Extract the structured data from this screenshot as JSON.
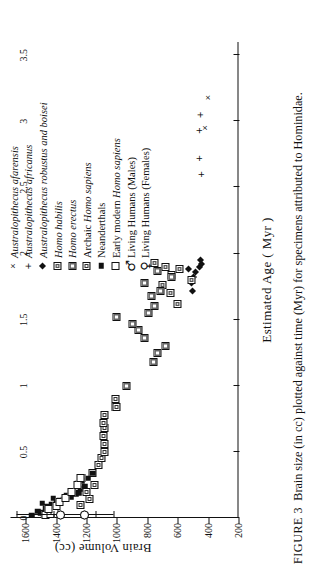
{
  "figure": {
    "number_label": "FIGURE 3",
    "caption": "Brain size (in cc) plotted against time (Myr) for specimens attributed to Hominidae."
  },
  "axes": {
    "x_title": "Estimated Age ( Myr )",
    "y_title": "Brain Volume  (cc)",
    "x_ticks": [
      "0",
      "0.5",
      "1",
      "1.5",
      "2",
      "2.5",
      "3",
      "3.5"
    ],
    "y_ticks": [
      "200",
      "400",
      "600",
      "800",
      "1000",
      "1200",
      "1400",
      "1600"
    ]
  },
  "legend": {
    "items": [
      {
        "marker": "cross-marker",
        "label": "Australopithecus afarensis",
        "italic": true
      },
      {
        "marker": "plus-marker",
        "label": "Australopithecus africanus",
        "italic": true
      },
      {
        "marker": "diamond-marker",
        "label": "Australopithecus robustus and boisei",
        "italic": true
      },
      {
        "marker": "square-hatched-marker",
        "label": "Homo habilis",
        "italic": true
      },
      {
        "marker": "square-shaded-marker",
        "label": "Homo erectus",
        "italic": true
      },
      {
        "marker": "square-dotted-marker",
        "label": "Archaic Homo sapiens",
        "italic": false
      },
      {
        "marker": "square-filled-marker",
        "label": "Neanderthals",
        "italic": false
      },
      {
        "marker": "square-open-marker",
        "label": "Early modern Homo sapiens",
        "italic": false
      },
      {
        "marker": "mars-symbol",
        "label": "Living Humans (Males)",
        "italic": false
      },
      {
        "marker": "venus-symbol",
        "label": "Living Humans (Females)",
        "italic": false
      }
    ]
  },
  "chart_data": {
    "type": "scatter",
    "title": "Brain size (in cc) plotted against time (Myr) for specimens attributed to Hominidae.",
    "xlabel": "Estimated Age ( Myr )",
    "ylabel": "Brain Volume  (cc)",
    "xlim": [
      0,
      3.6
    ],
    "ylim": [
      200,
      1700
    ],
    "grid": false,
    "legend_position": "top-right",
    "series": [
      {
        "name": "Australopithecus afarensis",
        "marker": "x",
        "points": [
          [
            2.95,
            415
          ],
          [
            3.18,
            400
          ]
        ]
      },
      {
        "name": "Australopithecus africanus",
        "marker": "+",
        "points": [
          [
            2.6,
            445
          ],
          [
            2.72,
            455
          ],
          [
            2.93,
            455
          ],
          [
            3.05,
            450
          ]
        ]
      },
      {
        "name": "Australopithecus robustus and boisei",
        "marker": "diamond-filled",
        "points": [
          [
            1.72,
            500
          ],
          [
            1.78,
            510
          ],
          [
            1.82,
            495
          ],
          [
            1.86,
            480
          ],
          [
            1.88,
            530
          ],
          [
            1.9,
            455
          ],
          [
            1.92,
            445
          ],
          [
            1.95,
            450
          ]
        ]
      },
      {
        "name": "Homo habilis",
        "marker": "square-hatched",
        "points": [
          [
            1.62,
            600
          ],
          [
            1.7,
            650
          ],
          [
            1.76,
            700
          ],
          [
            1.8,
            510
          ],
          [
            1.84,
            640
          ],
          [
            1.88,
            590
          ],
          [
            1.9,
            680
          ],
          [
            1.93,
            750
          ]
        ]
      },
      {
        "name": "Homo erectus",
        "marker": "square-shaded",
        "points": [
          [
            0.84,
            1010
          ],
          [
            1.0,
            940
          ],
          [
            1.18,
            760
          ],
          [
            1.25,
            730
          ],
          [
            1.3,
            680
          ],
          [
            1.36,
            820
          ],
          [
            1.42,
            860
          ],
          [
            1.47,
            900
          ],
          [
            1.52,
            1000
          ],
          [
            1.55,
            790
          ],
          [
            1.6,
            750
          ],
          [
            1.68,
            770
          ],
          [
            1.72,
            710
          ],
          [
            1.78,
            820
          ],
          [
            1.82,
            640
          ],
          [
            1.87,
            730
          ]
        ]
      },
      {
        "name": "Archaic Homo sapiens",
        "marker": "square-dotted",
        "points": [
          [
            0.1,
            1240
          ],
          [
            0.14,
            1180
          ],
          [
            0.2,
            1200
          ],
          [
            0.25,
            1150
          ],
          [
            0.3,
            1230
          ],
          [
            0.34,
            1160
          ],
          [
            0.4,
            1120
          ],
          [
            0.45,
            1100
          ],
          [
            0.5,
            1080
          ],
          [
            0.56,
            1080
          ],
          [
            0.62,
            1090
          ],
          [
            0.68,
            1080
          ],
          [
            0.72,
            1090
          ],
          [
            0.78,
            1080
          ],
          [
            0.84,
            1000
          ],
          [
            0.9,
            1010
          ]
        ]
      },
      {
        "name": "Neanderthals",
        "marker": "square-filled",
        "points": [
          [
            0.02,
            1560
          ],
          [
            0.03,
            1480
          ],
          [
            0.04,
            1500
          ],
          [
            0.05,
            1520
          ],
          [
            0.06,
            1450
          ],
          [
            0.07,
            1470
          ],
          [
            0.08,
            1440
          ],
          [
            0.09,
            1460
          ],
          [
            0.1,
            1430
          ],
          [
            0.11,
            1490
          ],
          [
            0.12,
            1400
          ],
          [
            0.13,
            1380
          ],
          [
            0.14,
            1350
          ],
          [
            0.15,
            1420
          ],
          [
            0.16,
            1300
          ],
          [
            0.17,
            1330
          ],
          [
            0.18,
            1270
          ],
          [
            0.19,
            1250
          ],
          [
            0.2,
            1290
          ],
          [
            0.22,
            1240
          ],
          [
            0.24,
            1210
          ],
          [
            0.26,
            1260
          ],
          [
            0.28,
            1230
          ],
          [
            0.3,
            1190
          ],
          [
            0.34,
            1160
          ]
        ]
      },
      {
        "name": "Early modern Homo sapiens",
        "marker": "square-open",
        "points": [
          [
            0.02,
            1470
          ],
          [
            0.03,
            1440
          ],
          [
            0.05,
            1410
          ],
          [
            0.07,
            1450
          ],
          [
            0.09,
            1400
          ],
          [
            0.12,
            1380
          ],
          [
            0.15,
            1340
          ],
          [
            0.2,
            1300
          ],
          [
            0.25,
            1260
          ],
          [
            0.3,
            1240
          ]
        ]
      },
      {
        "name": "Living Humans (Males)",
        "marker": "circle-open-with-errorbar",
        "points": [
          [
            0.02,
            1370
          ]
        ],
        "error_bar_range": [
          1140,
          1660
        ]
      },
      {
        "name": "Living Humans (Females)",
        "marker": "circle-open-with-errorbar",
        "points": [
          [
            0.02,
            1210
          ]
        ],
        "error_bar_range": [
          1020,
          1420
        ]
      }
    ]
  }
}
